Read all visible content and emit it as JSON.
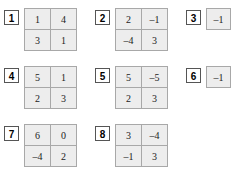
{
  "worksheet": {
    "colors": {
      "cell_fill": "#ededed",
      "cell_border": "#a8a8a8",
      "label_border": "#555555",
      "page_background": "#ffffff",
      "text": "#222222"
    },
    "problems": [
      {
        "number": "1",
        "rows": 2,
        "cols": 2,
        "matrix": [
          [
            "1",
            "4"
          ],
          [
            "3",
            "1"
          ]
        ]
      },
      {
        "number": "2",
        "rows": 2,
        "cols": 2,
        "matrix": [
          [
            "2",
            "–1"
          ],
          [
            "–4",
            "3"
          ]
        ]
      },
      {
        "number": "3",
        "rows": 1,
        "cols": 1,
        "matrix": [
          [
            "–1"
          ]
        ]
      },
      {
        "number": "4",
        "rows": 2,
        "cols": 2,
        "matrix": [
          [
            "5",
            "1"
          ],
          [
            "2",
            "3"
          ]
        ]
      },
      {
        "number": "5",
        "rows": 2,
        "cols": 2,
        "matrix": [
          [
            "5",
            "–5"
          ],
          [
            "2",
            "3"
          ]
        ]
      },
      {
        "number": "6",
        "rows": 1,
        "cols": 1,
        "matrix": [
          [
            "–1"
          ]
        ]
      },
      {
        "number": "7",
        "rows": 2,
        "cols": 2,
        "matrix": [
          [
            "6",
            "0"
          ],
          [
            "–4",
            "2"
          ]
        ]
      },
      {
        "number": "8",
        "rows": 2,
        "cols": 2,
        "matrix": [
          [
            "3",
            "–4"
          ],
          [
            "–1",
            "3"
          ]
        ]
      }
    ]
  }
}
